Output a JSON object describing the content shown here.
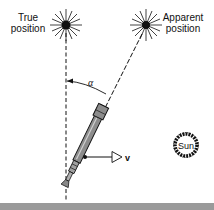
{
  "figure": {
    "true_position": {
      "label_line1": "True",
      "label_line2": "position"
    },
    "apparent_position": {
      "label_line1": "Apparent",
      "label_line2": "position"
    },
    "angle_label": "α",
    "velocity_label": "v",
    "sun_label": "Sun"
  },
  "colors": {
    "ink": "#111111",
    "telescope_body": "#8c8c8c",
    "bottom_bar": "#9a9a9a",
    "background": "#ffffff"
  }
}
